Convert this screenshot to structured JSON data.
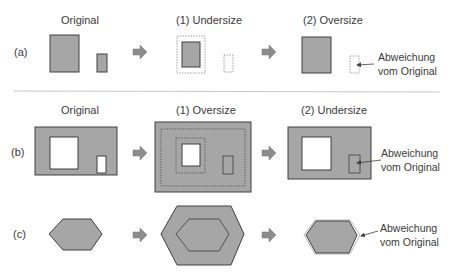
{
  "colors": {
    "fill": "#a6a6a6",
    "stroke": "#404040",
    "arrow": "#8c8c8c",
    "dashed": "#8a8a8a",
    "divider": "#c8c8c8",
    "hole": "#ffffff"
  },
  "rows": {
    "a": {
      "label": "(a)",
      "headers": [
        "Original",
        "(1) Undersize",
        "(2) Oversize"
      ],
      "note": [
        "Abweichung",
        "vom Original"
      ]
    },
    "b": {
      "label": "(b)",
      "headers": [
        "Original",
        "(1) Oversize",
        "(2) Undersize"
      ],
      "note": [
        "Abweichung",
        "vom Original"
      ]
    },
    "c": {
      "label": "(c)",
      "headers": [],
      "note": [
        "Abweichung",
        "vom Original"
      ]
    }
  }
}
